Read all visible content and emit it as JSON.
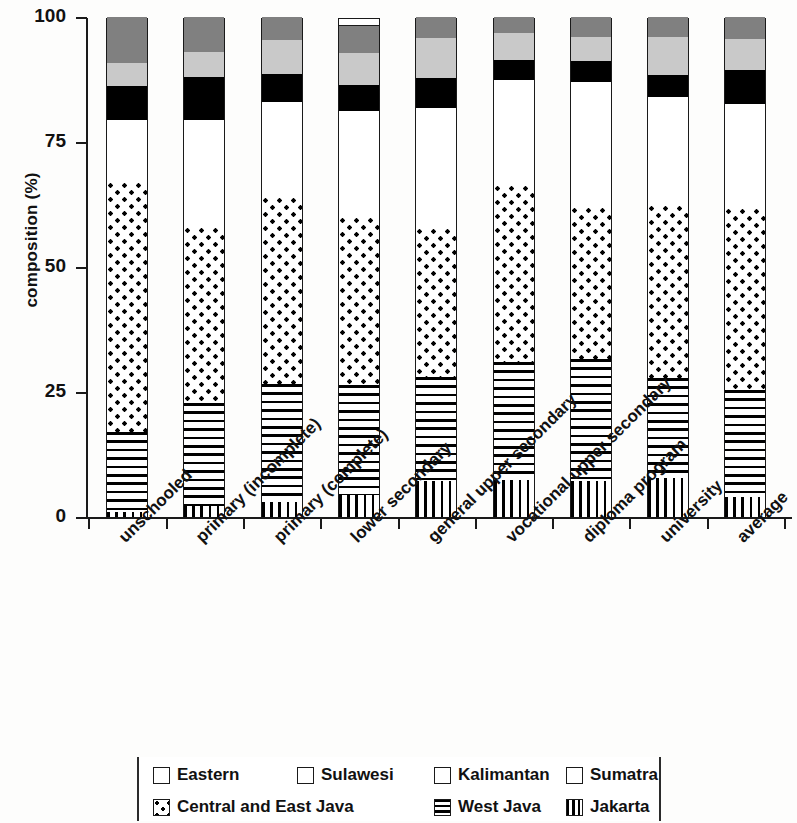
{
  "chart_data": {
    "type": "bar",
    "stacked": true,
    "title": "",
    "xlabel": "",
    "ylabel": "composition (%)",
    "ylim": [
      0,
      100
    ],
    "yticks": [
      "0",
      "25",
      "50",
      "75",
      "100"
    ],
    "grid": false,
    "legend_position": "bottom",
    "categories": [
      "unschooled",
      "primary (incomplete)",
      "primary (complete)",
      "lower secondary",
      "general upper secondary",
      "vocational upper secondary",
      "diploma program",
      "university",
      "average"
    ],
    "series": [
      {
        "name": "Jakarta",
        "pattern": "vertical-lines",
        "color": "#ffffff",
        "values": [
          1.0,
          2.2,
          3.0,
          4.4,
          7.2,
          7.4,
          7.2,
          7.8,
          4.0
        ]
      },
      {
        "name": "West Java",
        "pattern": "horizontal-lines",
        "color": "#ffffff",
        "values": [
          16.0,
          20.6,
          23.6,
          22.0,
          20.8,
          23.6,
          24.4,
          20.0,
          21.4
        ]
      },
      {
        "name": "Central and East Java",
        "pattern": "dots",
        "color": "#ffffff",
        "values": [
          50.0,
          35.2,
          37.4,
          33.6,
          29.8,
          35.4,
          30.4,
          34.6,
          36.4
        ]
      },
      {
        "name": "Sumatra",
        "pattern": "solid",
        "color": "#ffffff",
        "values": [
          12.4,
          21.4,
          19.0,
          21.2,
          24.0,
          21.0,
          25.0,
          21.6,
          20.8
        ]
      },
      {
        "name": "Kalimantan",
        "pattern": "solid",
        "color": "#000000",
        "values": [
          6.8,
          8.6,
          5.6,
          5.2,
          6.0,
          4.0,
          4.2,
          4.4,
          6.8
        ]
      },
      {
        "name": "Sulawesi",
        "pattern": "solid",
        "color": "#c9c9c9",
        "values": [
          4.6,
          5.0,
          6.8,
          6.4,
          8.0,
          5.4,
          4.8,
          7.6,
          6.2
        ]
      },
      {
        "name": "Eastern",
        "pattern": "solid",
        "color": "#808080",
        "values": [
          9.2,
          7.0,
          4.6,
          5.4,
          4.2,
          3.2,
          4.0,
          4.0,
          4.4
        ]
      }
    ]
  },
  "axis": {
    "y_title": "composition (%)",
    "y_ticks": [
      "100",
      "75",
      "50",
      "25",
      "0"
    ]
  },
  "legend": {
    "rows": [
      [
        {
          "label": "Eastern",
          "key": "eastern"
        },
        {
          "label": "Sulawesi",
          "key": "sulawesi"
        },
        {
          "label": "Kalimantan",
          "key": "kalimantan"
        },
        {
          "label": "Sumatra",
          "key": "sumatra"
        }
      ],
      [
        {
          "label": "Central and East Java",
          "key": "cejava"
        },
        {
          "label": "West Java",
          "key": "westjava"
        },
        {
          "label": "Jakarta",
          "key": "jakarta"
        }
      ]
    ]
  },
  "colors": {
    "eastern": "#808080",
    "sulawesi": "#c9c9c9",
    "kalimantan": "#000000",
    "sumatra": "#ffffff",
    "axis": "#1a1a1a",
    "background": "#fdfdfc"
  }
}
